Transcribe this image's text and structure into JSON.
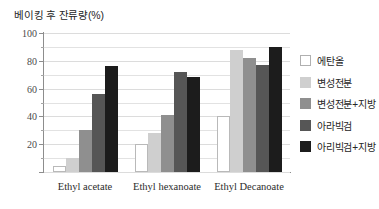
{
  "chart_data": {
    "type": "bar",
    "title": "베이킹 후 잔류량(%)",
    "xlabel": "",
    "ylabel": "",
    "ylim": [
      0,
      100
    ],
    "yticks": [
      0,
      20,
      40,
      60,
      80,
      100
    ],
    "ytick_labels": [
      "",
      "20",
      "40",
      "60",
      "80",
      "100"
    ],
    "y_minor_step": 10,
    "grid": true,
    "legend_position": "right",
    "categories": [
      "Ethyl acetate",
      "Ethyl hexanoate",
      "Ethyl Decanoate"
    ],
    "series": [
      {
        "name": "에탄올",
        "color": "#ffffff",
        "values": [
          4,
          20,
          40
        ]
      },
      {
        "name": "변성전분",
        "color": "#cfcfcf",
        "values": [
          10,
          28,
          88
        ]
      },
      {
        "name": "변성전분+지방",
        "color": "#8f8f8f",
        "values": [
          30,
          41,
          82
        ]
      },
      {
        "name": "아라빅검",
        "color": "#565656",
        "values": [
          56,
          72,
          77
        ]
      },
      {
        "name": "아리빅검+지방",
        "color": "#1c1c1c",
        "values": [
          76,
          68,
          90
        ]
      }
    ]
  }
}
